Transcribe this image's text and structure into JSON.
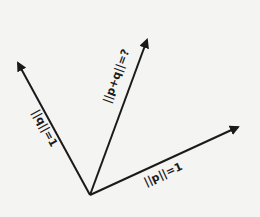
{
  "diagram": {
    "type": "vector-addition",
    "origin": {
      "x": 90,
      "y": 195
    },
    "vectors": [
      {
        "id": "p",
        "label": "||p||=1",
        "tip": {
          "x": 238,
          "y": 127
        }
      },
      {
        "id": "q",
        "label": "||q||=1",
        "tip": {
          "x": 18,
          "y": 63
        }
      },
      {
        "id": "p_plus_q",
        "label": "||p+q||=?",
        "tip": {
          "x": 147,
          "y": 40
        }
      }
    ],
    "colors": {
      "background": "#f4f4f2",
      "stroke": "#1a1a1a"
    }
  }
}
